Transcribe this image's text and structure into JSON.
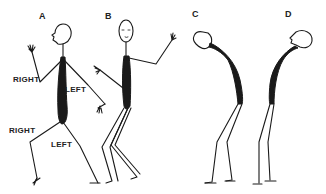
{
  "figure": {
    "figures": [
      {
        "id": "A",
        "label": "A",
        "pose": "walking, profile facing left"
      },
      {
        "id": "B",
        "label": "B",
        "pose": "walking, facing front"
      },
      {
        "id": "C",
        "label": "C",
        "pose": "bent forward, head down"
      },
      {
        "id": "D",
        "label": "D",
        "pose": "bent forward, head tilted up"
      }
    ],
    "annotations": [
      {
        "text": "RIGHT",
        "target": "A right arm"
      },
      {
        "text": "LEFT",
        "target": "A left arm"
      },
      {
        "text": "RIGHT",
        "target": "A right leg"
      },
      {
        "text": "LEFT",
        "target": "A left leg"
      }
    ],
    "colors": {
      "ink": "#1a1a1a",
      "background": "#ffffff"
    }
  }
}
